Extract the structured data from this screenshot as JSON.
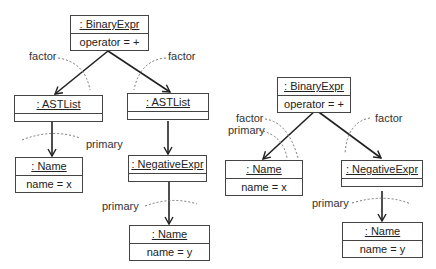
{
  "left_tree": {
    "root": {
      "header": ": BinaryExpr",
      "attribute": "operator = +"
    },
    "left_child": {
      "header": ": ASTList"
    },
    "right_child": {
      "header": ": ASTList"
    },
    "left_leaf": {
      "header": ": Name",
      "attribute": "name = x"
    },
    "right_mid": {
      "header": ": NegativeExpr"
    },
    "right_leaf": {
      "header": ": Name",
      "attribute": "name = y"
    },
    "labels": {
      "factor_left": "factor",
      "factor_right": "factor",
      "primary_left": "primary",
      "primary_right": "primary"
    }
  },
  "right_tree": {
    "root": {
      "header": ": BinaryExpr",
      "attribute": "operator = +"
    },
    "left_child": {
      "header": ": Name",
      "attribute": "name = x"
    },
    "right_child": {
      "header": ": NegativeExpr"
    },
    "right_leaf": {
      "header": ": Name",
      "attribute": "name = y"
    },
    "labels": {
      "factor_left": "factor",
      "primary_left": "primary",
      "factor_right": "factor",
      "primary_right": "primary"
    }
  }
}
